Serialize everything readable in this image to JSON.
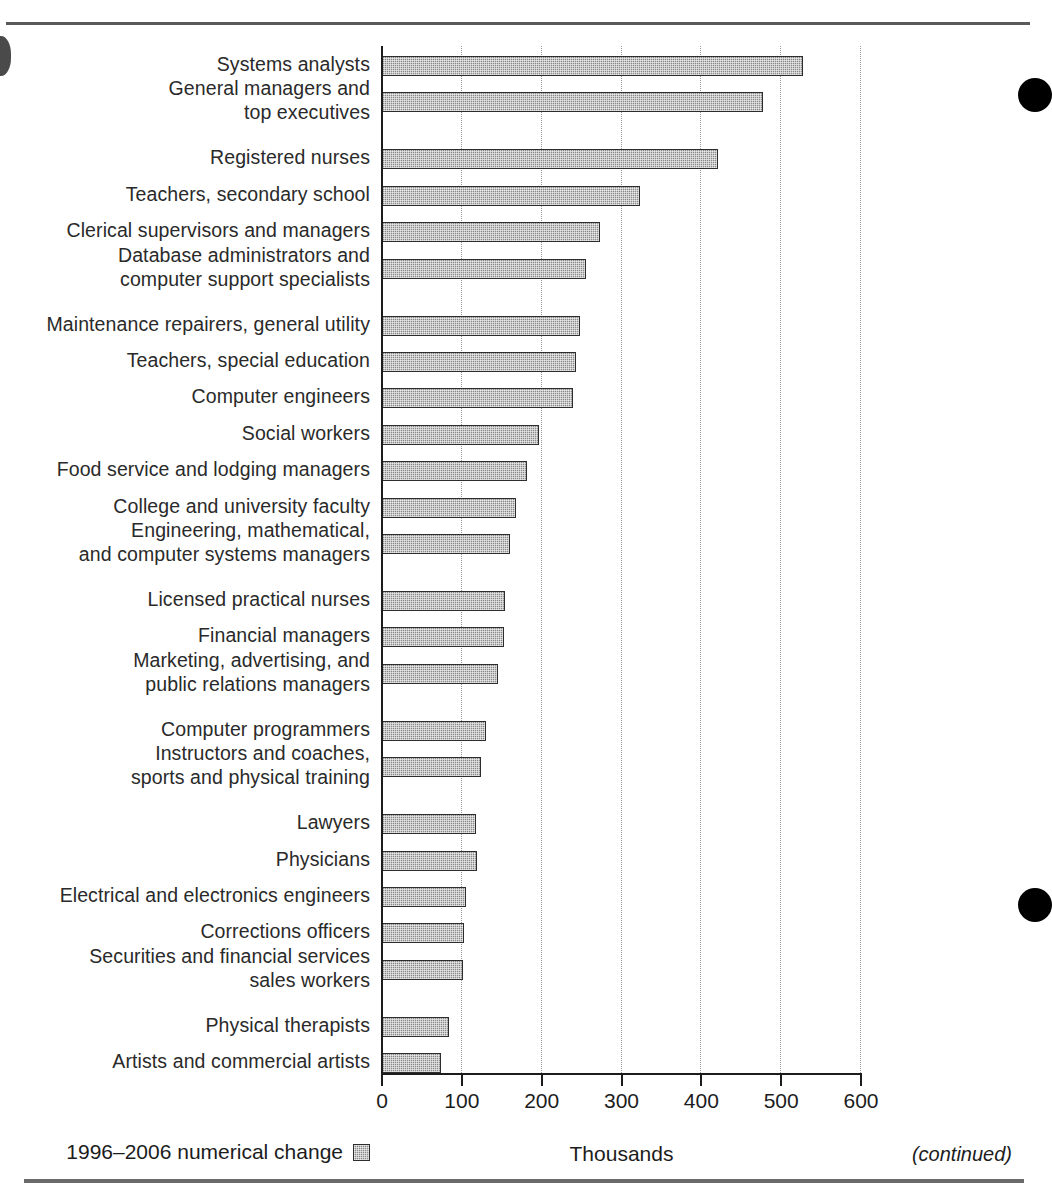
{
  "page": {
    "continued_note": "(continued)",
    "legend_label": "1996–2006 numerical change",
    "legend_swatch_color": "#8a8a8a"
  },
  "chart_data": {
    "type": "bar",
    "orientation": "horizontal",
    "title": "",
    "xlabel": "Thousands",
    "ylabel": "",
    "xlim": [
      0,
      600
    ],
    "xticks": [
      0,
      100,
      200,
      300,
      400,
      500,
      600
    ],
    "xtick_labels": [
      "0",
      "100",
      "200",
      "300",
      "400",
      "500",
      "600"
    ],
    "grid": true,
    "grid_axis": "x",
    "legend": [
      "1996–2006 numerical change"
    ],
    "legend_position": "below-left",
    "series_name": "1996–2006 numerical change",
    "units": "Thousands",
    "bar_color": "#8a8a8a",
    "bar_edge_color": "#2d2d2d",
    "categories": [
      "Systems analysts",
      "General managers and top executives",
      "Registered nurses",
      "Teachers, secondary school",
      "Clerical supervisors and managers",
      "Database administrators and computer support specialists",
      "Maintenance repairers, general utility",
      "Teachers, special education",
      "Computer engineers",
      "Social workers",
      "Food service and lodging managers",
      "College and university faculty",
      "Engineering, mathematical, and computer systems managers",
      "Licensed practical nurses",
      "Financial managers",
      "Marketing, advertising, and public relations managers",
      "Computer programmers",
      "Instructors and coaches, sports and physical training",
      "Lawyers",
      "Physicians",
      "Electrical and electronics engineers",
      "Corrections officers",
      "Securities and financial services sales workers",
      "Physical therapists",
      "Artists and commercial artists"
    ],
    "values": [
      529,
      478,
      422,
      324,
      274,
      257,
      249,
      244,
      240,
      198,
      183,
      169,
      161,
      155,
      154,
      147,
      131,
      125,
      119,
      120,
      107,
      104,
      103,
      85,
      75
    ],
    "rows": [
      {
        "label_lines": [
          "Systems analysts"
        ],
        "value": 529
      },
      {
        "label_lines": [
          "General managers and",
          "top executives"
        ],
        "value": 478
      },
      {
        "label_lines": [
          "Registered nurses"
        ],
        "value": 422
      },
      {
        "label_lines": [
          "Teachers, secondary school"
        ],
        "value": 324
      },
      {
        "label_lines": [
          "Clerical supervisors and managers"
        ],
        "value": 274
      },
      {
        "label_lines": [
          "Database administrators and",
          "computer support specialists"
        ],
        "value": 257
      },
      {
        "label_lines": [
          "Maintenance repairers, general utility"
        ],
        "value": 249
      },
      {
        "label_lines": [
          "Teachers, special education"
        ],
        "value": 244
      },
      {
        "label_lines": [
          "Computer engineers"
        ],
        "value": 240
      },
      {
        "label_lines": [
          "Social workers"
        ],
        "value": 198
      },
      {
        "label_lines": [
          "Food service and lodging managers"
        ],
        "value": 183
      },
      {
        "label_lines": [
          "College and university faculty"
        ],
        "value": 169
      },
      {
        "label_lines": [
          "Engineering, mathematical,",
          "and computer systems managers"
        ],
        "value": 161
      },
      {
        "label_lines": [
          "Licensed practical nurses"
        ],
        "value": 155
      },
      {
        "label_lines": [
          "Financial managers"
        ],
        "value": 154
      },
      {
        "label_lines": [
          "Marketing, advertising, and",
          "public relations managers"
        ],
        "value": 147
      },
      {
        "label_lines": [
          "Computer programmers"
        ],
        "value": 131
      },
      {
        "label_lines": [
          "Instructors and coaches,",
          "sports and physical training"
        ],
        "value": 125
      },
      {
        "label_lines": [
          "Lawyers"
        ],
        "value": 119
      },
      {
        "label_lines": [
          "Physicians"
        ],
        "value": 120
      },
      {
        "label_lines": [
          "Electrical and electronics engineers"
        ],
        "value": 107
      },
      {
        "label_lines": [
          "Corrections officers"
        ],
        "value": 104
      },
      {
        "label_lines": [
          "Securities and financial services",
          "sales workers"
        ],
        "value": 103
      },
      {
        "label_lines": [
          "Physical therapists"
        ],
        "value": 85
      },
      {
        "label_lines": [
          "Artists and commercial artists"
        ],
        "value": 75
      }
    ]
  }
}
